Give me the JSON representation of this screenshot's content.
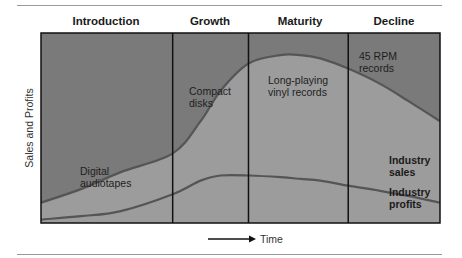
{
  "chart_data": {
    "type": "line",
    "title": "",
    "xlabel": "Time",
    "ylabel": "Sales and Profits",
    "stages": [
      "Introduction",
      "Growth",
      "Maturity",
      "Decline"
    ],
    "stage_boundaries": [
      0,
      0.33,
      0.52,
      0.77,
      1.0
    ],
    "x": [
      0,
      0.1,
      0.2,
      0.33,
      0.4,
      0.45,
      0.52,
      0.6,
      0.65,
      0.7,
      0.77,
      0.85,
      0.92,
      1.0
    ],
    "series": [
      {
        "name": "Industry sales",
        "values": [
          0,
          0.08,
          0.18,
          0.29,
          0.48,
          0.66,
          0.82,
          0.87,
          0.87,
          0.85,
          0.79,
          0.7,
          0.6,
          0.48
        ]
      },
      {
        "name": "Industry profits",
        "values": [
          -0.1,
          -0.08,
          -0.05,
          0.05,
          0.13,
          0.16,
          0.16,
          0.15,
          0.14,
          0.13,
          0.1,
          0.07,
          0.04,
          0.0
        ]
      }
    ],
    "ylim": [
      -0.12,
      1.0
    ],
    "grid": false,
    "annotations": [
      {
        "text": [
          "Digital",
          "audiotapes"
        ],
        "stage": "Introduction"
      },
      {
        "text": [
          "Compact",
          "disks"
        ],
        "stage": "Growth"
      },
      {
        "text": [
          "Long-playing",
          "vinyl records"
        ],
        "stage": "Maturity"
      },
      {
        "text": [
          "45 RPM",
          "records"
        ],
        "stage": "Decline"
      },
      {
        "text": [
          "Industry",
          "sales"
        ],
        "series": "Industry sales"
      },
      {
        "text": [
          "Industry",
          "profits"
        ],
        "series": "Industry profits"
      }
    ],
    "colors": {
      "above_curve": "#7a7a7a",
      "below_curve": "#9c9c9c",
      "line": "#555555",
      "frame": "#111111"
    }
  }
}
